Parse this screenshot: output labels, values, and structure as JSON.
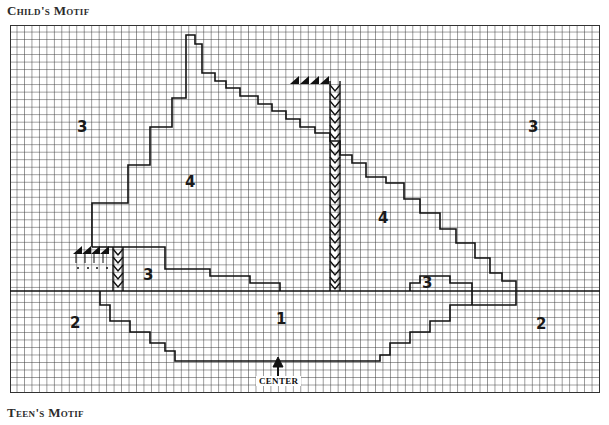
{
  "titles": {
    "top": "Child's Motif",
    "bottom": "Teen's Motif"
  },
  "chart": {
    "columns": 79,
    "rows": 49,
    "grid_color": "#3a3a3a",
    "outline_color": "#111111",
    "center_label": "CENTER",
    "region_labels": [
      {
        "id": "left-3",
        "text": "3",
        "x": 67,
        "y": 95
      },
      {
        "id": "right-3",
        "text": "3",
        "x": 528,
        "y": 95
      },
      {
        "id": "upper-4",
        "text": "4",
        "x": 185,
        "y": 150
      },
      {
        "id": "lower-4",
        "text": "4",
        "x": 378,
        "y": 186
      },
      {
        "id": "left-inner-3",
        "text": "3",
        "x": 143,
        "y": 243
      },
      {
        "id": "right-inner-3",
        "text": "3",
        "x": 422,
        "y": 251
      },
      {
        "id": "left-2",
        "text": "2",
        "x": 70,
        "y": 291
      },
      {
        "id": "center-1",
        "text": "1",
        "x": 276,
        "y": 287
      },
      {
        "id": "right-2",
        "text": "2",
        "x": 536,
        "y": 292
      }
    ]
  }
}
